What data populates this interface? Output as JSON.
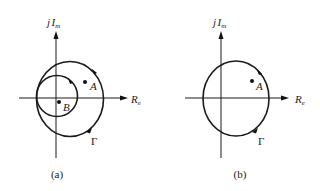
{
  "panels": [
    {
      "id": "a",
      "caption": "(a)",
      "axis_labels": {
        "imag_j": "j",
        "imag_main": "I",
        "imag_sub": "m",
        "real_main": "R",
        "real_sub": "e"
      },
      "points": [
        {
          "name": "A",
          "label": "A"
        },
        {
          "name": "B",
          "label": "B"
        }
      ],
      "contour_label": "Γ"
    },
    {
      "id": "b",
      "caption": "(b)",
      "axis_labels": {
        "imag_j": "j",
        "imag_main": "I",
        "imag_sub": "m",
        "real_main": "R",
        "real_sub": "e"
      },
      "points": [
        {
          "name": "A",
          "label": "A"
        }
      ],
      "contour_label": "Γ"
    }
  ]
}
